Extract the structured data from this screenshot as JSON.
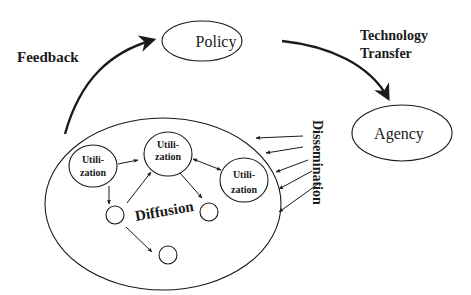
{
  "diagram": {
    "title_labels": {
      "feedback": "Feedback",
      "technology_transfer_line1": "Technology",
      "technology_transfer_line2": "Transfer",
      "dissemination": "Dissemination",
      "diffusion": "Diffusion"
    },
    "nodes": {
      "policy": "Policy",
      "agency": "Agency",
      "utilization_1_line1": "Utili-",
      "utilization_1_line2": "zation",
      "utilization_2_line1": "Utili-",
      "utilization_2_line2": "zation",
      "utilization_3_line1": "Utili-",
      "utilization_3_line2": "zation"
    },
    "edges": [
      {
        "from": "system-ellipse",
        "to": "policy",
        "label": "Feedback"
      },
      {
        "from": "policy",
        "to": "agency",
        "label": "Technology Transfer"
      },
      {
        "from": "agency",
        "to": "system-ellipse",
        "label": "Dissemination",
        "count": 5
      },
      {
        "from": "utilization-1",
        "to": "utilization-2"
      },
      {
        "from": "utilization-1",
        "to": "empty-node-1"
      },
      {
        "from": "empty-node-1",
        "to": "utilization-2"
      },
      {
        "from": "empty-node-1",
        "to": "empty-node-3"
      },
      {
        "from": "utilization-2",
        "to": "empty-node-2"
      },
      {
        "from": "utilization-2",
        "to": "utilization-3",
        "bidirectional": true
      }
    ]
  }
}
